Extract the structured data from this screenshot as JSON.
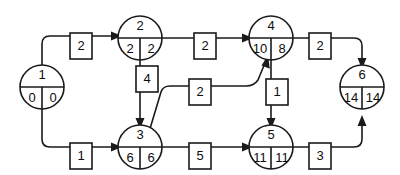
{
  "diagram": {
    "type": "activity-on-arrow-network",
    "nodes": [
      {
        "id": "1",
        "label": "1",
        "earliest": "0",
        "latest": "0",
        "cx": 42,
        "cy": 87
      },
      {
        "id": "2",
        "label": "2",
        "earliest": "2",
        "latest": "2",
        "cx": 140,
        "cy": 38
      },
      {
        "id": "3",
        "label": "3",
        "earliest": "6",
        "latest": "6",
        "cx": 140,
        "cy": 147
      },
      {
        "id": "4",
        "label": "4",
        "earliest": "10",
        "latest": "8",
        "cx": 271,
        "cy": 38
      },
      {
        "id": "5",
        "label": "5",
        "earliest": "11",
        "latest": "11",
        "cx": 271,
        "cy": 147
      },
      {
        "id": "6",
        "label": "6",
        "earliest": "14",
        "latest": "14",
        "cx": 362,
        "cy": 87
      }
    ],
    "edges": [
      {
        "name": "edge-1-2",
        "from": "1",
        "to": "2",
        "duration": "2",
        "box_x": 81,
        "box_y": 46
      },
      {
        "name": "edge-1-3",
        "from": "1",
        "to": "3",
        "duration": "1",
        "box_x": 81,
        "box_y": 156
      },
      {
        "name": "edge-2-4",
        "from": "2",
        "to": "4",
        "duration": "2",
        "box_x": 205,
        "box_y": 46
      },
      {
        "name": "edge-2-3",
        "from": "2",
        "to": "3",
        "duration": "4",
        "box_x": 147,
        "box_y": 79
      },
      {
        "name": "edge-3-4",
        "from": "3",
        "to": "4",
        "duration": "2",
        "box_x": 200,
        "box_y": 92
      },
      {
        "name": "edge-3-5",
        "from": "3",
        "to": "5",
        "duration": "5",
        "box_x": 200,
        "box_y": 156
      },
      {
        "name": "edge-4-6",
        "from": "4",
        "to": "6",
        "duration": "2",
        "box_x": 320,
        "box_y": 46
      },
      {
        "name": "edge-4-5",
        "from": "4",
        "to": "5",
        "duration": "1",
        "box_x": 277,
        "box_y": 92
      },
      {
        "name": "edge-5-6",
        "from": "5",
        "to": "6",
        "duration": "3",
        "box_x": 320,
        "box_y": 156
      }
    ],
    "colors": {
      "stroke": "#1a1a1a",
      "fill": "#ffffff",
      "text": "#0d0d0d"
    }
  }
}
